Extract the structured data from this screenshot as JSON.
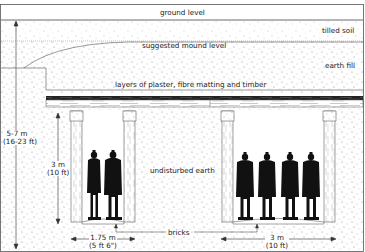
{
  "diagram": {
    "layers": {
      "ground_level": "ground level",
      "tilled_soil": "tilled soil",
      "suggested_mound": "suggested mound level",
      "earth_fill": "earth fill",
      "roof_layers": "layers of plaster, fibre matting and timber",
      "undisturbed": "undisturbed earth",
      "bricks": "bricks"
    },
    "dimensions": {
      "total_depth_m": "5-7 m",
      "total_depth_ft": "(16-23 ft)",
      "corridor_height_m": "3 m",
      "corridor_height_ft": "(10 ft)",
      "wall_width_m": "1.75 m",
      "wall_width_ft": "(5 ft 6\")",
      "corridor_width_m": "3 m",
      "corridor_width_ft": "(10 ft)"
    },
    "figures": {
      "left_corridor_count": 2,
      "right_corridor_count": 4
    },
    "colors": {
      "stipple": "#9a9a9a",
      "line": "#333333",
      "figure": "#111111",
      "background": "#ffffff"
    }
  }
}
